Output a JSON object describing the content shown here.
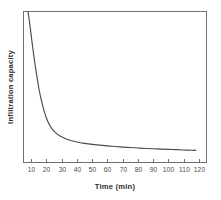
{
  "chart_data": {
    "type": "line",
    "title": "",
    "xlabel": "Time (min)",
    "ylabel": "Infiltration capacity",
    "xlim": [
      5,
      125
    ],
    "ylim": [
      0,
      100
    ],
    "grid": false,
    "legend": null,
    "xticks": [
      10,
      20,
      30,
      40,
      50,
      60,
      70,
      80,
      90,
      100,
      110,
      120
    ],
    "xtick_labels": [
      "10",
      "20",
      "30",
      "40",
      "50",
      "60",
      "70",
      "80",
      "90",
      "100",
      "110",
      "120"
    ],
    "yticks": [],
    "ytick_labels": [],
    "series": [
      {
        "name": "Infiltration capacity",
        "color": "#4a4a4a",
        "x": [
          8,
          9,
          10,
          11,
          12,
          13,
          14,
          15,
          16,
          17,
          18,
          19,
          20,
          22,
          24,
          26,
          28,
          30,
          33,
          36,
          40,
          45,
          50,
          55,
          60,
          65,
          70,
          75,
          80,
          85,
          90,
          95,
          100,
          105,
          110,
          115,
          118
        ],
        "y": [
          100,
          92.5,
          84.5,
          76.5,
          69.0,
          62.0,
          55.5,
          49.5,
          44.5,
          40.0,
          36.0,
          32.5,
          29.5,
          25.0,
          22.0,
          19.8,
          18.2,
          17.0,
          15.6,
          14.6,
          13.6,
          12.7,
          12.0,
          11.5,
          11.0,
          10.6,
          10.2,
          9.9,
          9.6,
          9.3,
          9.1,
          8.9,
          8.7,
          8.5,
          8.3,
          8.1,
          8.0
        ]
      }
    ],
    "axis_color": "#6f6f6f",
    "background_color": "#ffffff",
    "tick_direction": "in",
    "spines": [
      "left",
      "right",
      "top",
      "bottom"
    ]
  },
  "figure": {
    "x_axis_title": "Time (min)",
    "y_axis_title": "Infiltration capacity"
  }
}
